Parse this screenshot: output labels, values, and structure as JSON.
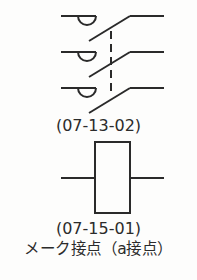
{
  "symbols": [
    {
      "name": "three-pole-switch-with-mechanical-interlock",
      "code": "(07-13-02)",
      "poles": 3
    },
    {
      "name": "relay-coil-box",
      "code": "(07-15-01)",
      "caption": "メーク接点（a接点）"
    }
  ],
  "colors": {
    "stroke": "#2a2a2a",
    "background": "#fdfdfc"
  }
}
